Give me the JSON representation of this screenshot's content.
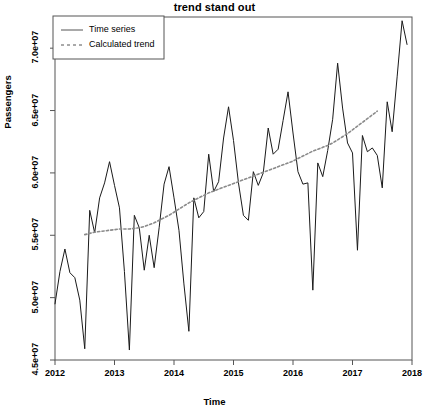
{
  "chart_data": {
    "type": "line",
    "title": "trend stand out",
    "xlabel": "Time",
    "ylabel": "Passengers",
    "grid": false,
    "legend_position": "top-left",
    "xlim": [
      2012.0,
      2018.0
    ],
    "ylim": [
      45000000,
      72500000
    ],
    "x_ticks": [
      2012,
      2013,
      2014,
      2015,
      2016,
      2017,
      2018
    ],
    "x_tick_labels": [
      "2012",
      "2013",
      "2014",
      "2015",
      "2016",
      "2017",
      "2018"
    ],
    "y_ticks": [
      45000000,
      50000000,
      55000000,
      60000000,
      65000000,
      70000000
    ],
    "y_tick_labels": [
      "4.5e+07",
      "5.0e+07",
      "5.5e+07",
      "6.0e+07",
      "6.5e+07",
      "7.0e+07"
    ],
    "series": [
      {
        "name": "Time series",
        "style": "solid",
        "color": "#1a1a1a",
        "x": [
          2012.0,
          2012.0833,
          2012.1667,
          2012.25,
          2012.3333,
          2012.4167,
          2012.5,
          2012.5833,
          2012.6667,
          2012.75,
          2012.8333,
          2012.9167,
          2013.0,
          2013.0833,
          2013.1667,
          2013.25,
          2013.3333,
          2013.4167,
          2013.5,
          2013.5833,
          2013.6667,
          2013.75,
          2013.8333,
          2013.9167,
          2014.0,
          2014.0833,
          2014.1667,
          2014.25,
          2014.3333,
          2014.4167,
          2014.5,
          2014.5833,
          2014.6667,
          2014.75,
          2014.8333,
          2014.9167,
          2015.0,
          2015.0833,
          2015.1667,
          2015.25,
          2015.3333,
          2015.4167,
          2015.5,
          2015.5833,
          2015.6667,
          2015.75,
          2015.8333,
          2015.9167,
          2016.0,
          2016.0833,
          2016.1667,
          2016.25,
          2016.3333,
          2016.4167,
          2016.5,
          2016.5833,
          2016.6667,
          2016.75,
          2016.8333,
          2016.9167,
          2017.0,
          2017.0833,
          2017.1667,
          2017.25,
          2017.3333,
          2017.4167,
          2017.5,
          2017.5833,
          2017.6667,
          2017.75,
          2017.8333,
          2017.9167
        ],
        "values": [
          49500000,
          52100000,
          53900000,
          52000000,
          51600000,
          49800000,
          45900000,
          57000000,
          55200000,
          58000000,
          59200000,
          60900000,
          59000000,
          57200000,
          52100000,
          45800000,
          56600000,
          55600000,
          52200000,
          55000000,
          52400000,
          55600000,
          59100000,
          60500000,
          58000000,
          55400000,
          51100000,
          47300000,
          58000000,
          56400000,
          56900000,
          61500000,
          58500000,
          59300000,
          62800000,
          65300000,
          62600000,
          59200000,
          56600000,
          56200000,
          60100000,
          59000000,
          60000000,
          63600000,
          61500000,
          61900000,
          64200000,
          66500000,
          63200000,
          60100000,
          59100000,
          59200000,
          50600000,
          60800000,
          59700000,
          61800000,
          64300000,
          68800000,
          65200000,
          62400000,
          61600000,
          53800000,
          63000000,
          61700000,
          62000000,
          61400000,
          58800000,
          65700000,
          63300000,
          67700000,
          72200000,
          70300000
        ]
      },
      {
        "name": "Calculated trend",
        "style": "dotted",
        "color": "#8a8a8a",
        "x": [
          2012.5,
          2012.5833,
          2012.6667,
          2012.75,
          2012.8333,
          2012.9167,
          2013.0,
          2013.0833,
          2013.1667,
          2013.25,
          2013.3333,
          2013.4167,
          2013.5,
          2013.5833,
          2013.6667,
          2013.75,
          2013.8333,
          2013.9167,
          2014.0,
          2014.0833,
          2014.1667,
          2014.25,
          2014.3333,
          2014.4167,
          2014.5,
          2014.5833,
          2014.6667,
          2014.75,
          2014.8333,
          2014.9167,
          2015.0,
          2015.0833,
          2015.1667,
          2015.25,
          2015.3333,
          2015.4167,
          2015.5,
          2015.5833,
          2015.6667,
          2015.75,
          2015.8333,
          2015.9167,
          2016.0,
          2016.0833,
          2016.1667,
          2016.25,
          2016.3333,
          2016.4167,
          2016.5,
          2016.5833,
          2016.6667,
          2016.75,
          2016.8333,
          2016.9167,
          2017.0,
          2017.0833,
          2017.1667,
          2017.25,
          2017.3333,
          2017.4167
        ],
        "values": [
          55050000,
          55150000,
          55250000,
          55300000,
          55350000,
          55400000,
          55450000,
          55500000,
          55500000,
          55500000,
          55550000,
          55600000,
          55700000,
          55850000,
          56000000,
          56200000,
          56400000,
          56600000,
          56850000,
          57100000,
          57350000,
          57600000,
          57800000,
          58000000,
          58200000,
          58400000,
          58550000,
          58700000,
          58850000,
          59000000,
          59150000,
          59300000,
          59450000,
          59600000,
          59750000,
          59900000,
          60050000,
          60200000,
          60350000,
          60500000,
          60650000,
          60800000,
          60950000,
          61150000,
          61350000,
          61550000,
          61750000,
          61900000,
          62050000,
          62200000,
          62400000,
          62650000,
          62900000,
          63150000,
          63450000,
          63750000,
          64050000,
          64350000,
          64650000,
          64950000
        ]
      }
    ]
  },
  "legend": {
    "items": [
      {
        "label": "Time series",
        "style": "solid"
      },
      {
        "label": "Calculated trend",
        "style": "dotted"
      }
    ]
  }
}
